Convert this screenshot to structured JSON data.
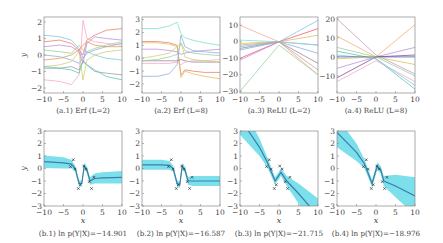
{
  "chart_data": [
    {
      "id": "a1",
      "type": "line",
      "title": "(a.1) Erf (L=2)",
      "xlabel": "",
      "ylabel": "y",
      "xlim": [
        -10,
        10
      ],
      "ylim": [
        -2.3,
        2.3
      ],
      "xticks": [
        -10,
        -5,
        0,
        5,
        10
      ],
      "yticks": [
        -2,
        -1,
        0,
        1,
        2
      ],
      "x": [
        -10,
        -6,
        -3,
        -1,
        0,
        1,
        3,
        6,
        10
      ],
      "series": [
        {
          "name": "s1",
          "color": "#7ec8e3",
          "values": [
            1.2,
            1.1,
            0.9,
            0.4,
            -0.2,
            0.2,
            0.0,
            -0.2,
            -0.3
          ]
        },
        {
          "name": "s2",
          "color": "#f08070",
          "values": [
            0.8,
            0.9,
            0.7,
            0.3,
            0.0,
            0.9,
            1.2,
            1.5,
            1.6
          ]
        },
        {
          "name": "s3",
          "color": "#9ad0a0",
          "values": [
            0.3,
            0.2,
            0.1,
            0.6,
            0.3,
            0.2,
            0.4,
            0.6,
            0.8
          ]
        },
        {
          "name": "s4",
          "color": "#f7a8d0",
          "values": [
            -1.5,
            -1.6,
            -1.8,
            -1.2,
            2.1,
            1.0,
            0.8,
            0.7,
            0.6
          ]
        },
        {
          "name": "s5",
          "color": "#8fb0e0",
          "values": [
            0.0,
            -0.1,
            -0.3,
            -0.5,
            -0.2,
            0.1,
            0.3,
            0.5,
            0.7
          ]
        },
        {
          "name": "s6",
          "color": "#e0a050",
          "values": [
            -0.3,
            -0.2,
            0.0,
            0.3,
            0.6,
            0.8,
            0.6,
            0.5,
            0.5
          ]
        },
        {
          "name": "s7",
          "color": "#a0a0a0",
          "values": [
            -0.8,
            -0.8,
            -0.7,
            -0.9,
            -0.4,
            -0.6,
            -1.0,
            -1.1,
            -1.2
          ]
        },
        {
          "name": "s8",
          "color": "#d0d070",
          "values": [
            -0.7,
            -0.6,
            -0.4,
            0.2,
            -1.5,
            -0.3,
            0.0,
            0.2,
            0.3
          ]
        },
        {
          "name": "s9",
          "color": "#60c8c0",
          "values": [
            -0.7,
            -0.8,
            -0.9,
            -1.1,
            -0.3,
            -0.6,
            -0.9,
            -1.3,
            -1.5
          ]
        },
        {
          "name": "s10",
          "color": "#c090e0",
          "values": [
            0.5,
            0.6,
            0.5,
            0.2,
            -0.5,
            0.7,
            1.1,
            1.0,
            0.9
          ]
        }
      ]
    },
    {
      "id": "a2",
      "type": "line",
      "title": "(a.2) Erf (L=8)",
      "xlabel": "",
      "ylabel": "",
      "xlim": [
        -10,
        10
      ],
      "ylim": [
        -2.7,
        3.2
      ],
      "xticks": [
        -10,
        -5,
        0,
        5,
        10
      ],
      "yticks": [
        -2,
        -1,
        0,
        1,
        2,
        3
      ],
      "x": [
        -10,
        -6,
        -3,
        -1,
        0,
        1,
        3,
        6,
        10
      ],
      "series": [
        {
          "name": "s1",
          "color": "#80e0d0",
          "values": [
            2.3,
            2.3,
            2.5,
            2.8,
            1.9,
            1.6,
            1.4,
            1.2,
            1.0
          ]
        },
        {
          "name": "s2",
          "color": "#f08070",
          "values": [
            1.3,
            1.3,
            1.2,
            1.0,
            -1.3,
            -0.9,
            -1.0,
            -1.1,
            -1.1
          ]
        },
        {
          "name": "s3",
          "color": "#e0c060",
          "values": [
            1.2,
            1.2,
            1.1,
            0.9,
            -1.5,
            -1.0,
            -1.2,
            -1.4,
            -1.6
          ]
        },
        {
          "name": "s4",
          "color": "#c090e0",
          "values": [
            0.7,
            0.7,
            0.6,
            0.5,
            0.3,
            0.4,
            0.5,
            0.6,
            0.7
          ]
        },
        {
          "name": "s5",
          "color": "#8fb0e0",
          "values": [
            -1.4,
            -1.4,
            -1.2,
            -0.5,
            1.8,
            0.9,
            0.6,
            0.5,
            0.4
          ]
        },
        {
          "name": "s6",
          "color": "#909090",
          "values": [
            -0.2,
            -0.2,
            -0.2,
            -0.2,
            -0.1,
            -0.2,
            -0.3,
            -0.3,
            -0.3
          ]
        },
        {
          "name": "s7",
          "color": "#f7a8d0",
          "values": [
            -0.4,
            -0.4,
            -0.4,
            -0.3,
            -0.5,
            -0.3,
            -0.2,
            -0.2,
            -0.1
          ]
        },
        {
          "name": "s8",
          "color": "#9ad0a0",
          "values": [
            -0.2,
            -0.1,
            0.1,
            0.3,
            1.2,
            0.6,
            0.4,
            0.3,
            0.2
          ]
        },
        {
          "name": "s9",
          "color": "#d0d070",
          "values": [
            0.0,
            0.2,
            0.4,
            0.9,
            1.2,
            0.1,
            -0.1,
            -0.2,
            -0.3
          ]
        }
      ]
    },
    {
      "id": "a3",
      "type": "line",
      "title": "(a.3) ReLU (L=2)",
      "xlabel": "",
      "ylabel": "",
      "xlim": [
        -10,
        10
      ],
      "ylim": [
        -31,
        15
      ],
      "xticks": [
        -10,
        -5,
        0,
        5,
        10
      ],
      "yticks": [
        -30,
        -20,
        -10,
        0,
        10
      ],
      "x": [
        -10,
        0,
        10
      ],
      "series": [
        {
          "name": "s1",
          "color": "#f0b0a0",
          "values": [
            10,
            0,
            -20
          ]
        },
        {
          "name": "s2",
          "color": "#7ec8e3",
          "values": [
            -3,
            0,
            13
          ]
        },
        {
          "name": "s3",
          "color": "#f06070",
          "values": [
            -10,
            0,
            8
          ]
        },
        {
          "name": "s4",
          "color": "#9ad0a0",
          "values": [
            -30,
            -2,
            -20
          ]
        },
        {
          "name": "s5",
          "color": "#e0c060",
          "values": [
            -1,
            0,
            4
          ]
        },
        {
          "name": "s6",
          "color": "#c090e0",
          "values": [
            -11,
            0,
            -2
          ]
        },
        {
          "name": "s7",
          "color": "#909090",
          "values": [
            -4,
            0,
            -13
          ]
        },
        {
          "name": "s8",
          "color": "#80e0d0",
          "values": [
            1,
            0,
            -2
          ]
        },
        {
          "name": "s9",
          "color": "#8fb0e0",
          "values": [
            -5,
            0,
            -7
          ]
        },
        {
          "name": "s10",
          "color": "#d0a0a0",
          "values": [
            -2,
            0,
            -17
          ]
        }
      ]
    },
    {
      "id": "a4",
      "type": "line",
      "title": "(a.4) ReLU (L=8)",
      "xlabel": "",
      "ylabel": "",
      "xlim": [
        -10,
        10
      ],
      "ylim": [
        -19,
        21
      ],
      "xticks": [
        -10,
        -5,
        0,
        5,
        10
      ],
      "yticks": [
        -10,
        0,
        10,
        20
      ],
      "x": [
        -10,
        0,
        10
      ],
      "series": [
        {
          "name": "s1",
          "color": "#c0a0c0",
          "values": [
            20,
            1,
            -9
          ]
        },
        {
          "name": "s2",
          "color": "#f0b070",
          "values": [
            11,
            0,
            17
          ]
        },
        {
          "name": "s3",
          "color": "#9ad0a0",
          "values": [
            5,
            0,
            -10
          ]
        },
        {
          "name": "s4",
          "color": "#60c0c0",
          "values": [
            3,
            -1,
            -17
          ]
        },
        {
          "name": "s5",
          "color": "#c090e0",
          "values": [
            -6,
            0,
            5
          ]
        },
        {
          "name": "s6",
          "color": "#8050a0",
          "values": [
            -11,
            0,
            1
          ]
        },
        {
          "name": "s7",
          "color": "#f7a8d0",
          "values": [
            -13,
            -2,
            -13
          ]
        },
        {
          "name": "s8",
          "color": "#7ec8e3",
          "values": [
            1,
            -1,
            -15
          ]
        },
        {
          "name": "s9",
          "color": "#4060a0",
          "values": [
            0,
            0,
            0
          ]
        },
        {
          "name": "s10",
          "color": "#e0c060",
          "values": [
            -1,
            0,
            -4
          ]
        }
      ]
    },
    {
      "id": "b1",
      "type": "line",
      "title": "(b.1) ln p(Y|X)=−14.901",
      "xlabel": "x",
      "ylabel": "y",
      "xlim": [
        -10,
        10
      ],
      "ylim": [
        -3,
        3
      ],
      "xticks": [
        -10,
        -5,
        0,
        5,
        10
      ],
      "yticks": [
        -3,
        -2,
        -1,
        0,
        1,
        2,
        3
      ],
      "x": [
        -10,
        -5,
        -3,
        -2,
        -1,
        -0.3,
        0.3,
        1,
        1.8,
        3,
        5,
        10
      ],
      "mean": [
        0.55,
        0.45,
        0.35,
        0.0,
        -1.2,
        -1.2,
        0.2,
        -0.1,
        -1.0,
        -0.8,
        -0.75,
        -0.7
      ],
      "band_halfwidth": [
        0.5,
        0.45,
        0.35,
        0.25,
        0.25,
        0.25,
        0.25,
        0.25,
        0.3,
        0.4,
        0.45,
        0.5
      ],
      "points": {
        "x": [
          -3.2,
          -2.5,
          -2.0,
          -1.2,
          -0.7,
          0.2,
          0.8,
          1.6,
          2.2,
          2.8
        ],
        "y": [
          0.15,
          0.7,
          -0.05,
          -1.6,
          -1.3,
          0.2,
          -0.05,
          -1.05,
          -1.6,
          -0.7
        ]
      },
      "log_likelihood": -14.901
    },
    {
      "id": "b2",
      "type": "line",
      "title": "(b.2) ln p(Y|X)=−16.587",
      "xlabel": "x",
      "ylabel": "",
      "xlim": [
        -10,
        10
      ],
      "ylim": [
        -3,
        3
      ],
      "xticks": [
        -10,
        -5,
        0,
        5,
        10
      ],
      "yticks": [
        -3,
        -2,
        -1,
        0,
        1,
        2,
        3
      ],
      "x": [
        -10,
        -5,
        -3,
        -2,
        -1,
        -0.3,
        0.3,
        1,
        1.8,
        3,
        5,
        10
      ],
      "mean": [
        0.3,
        0.3,
        0.25,
        0.0,
        -1.2,
        -1.3,
        0.2,
        -0.1,
        -1.0,
        -1.0,
        -1.0,
        -1.0
      ],
      "band_halfwidth": [
        0.4,
        0.4,
        0.35,
        0.25,
        0.25,
        0.25,
        0.25,
        0.25,
        0.3,
        0.4,
        0.4,
        0.4
      ],
      "points": {
        "x": [
          -3.2,
          -2.5,
          -2.0,
          -1.2,
          -0.7,
          0.2,
          0.8,
          1.6,
          2.2,
          2.8
        ],
        "y": [
          0.15,
          0.7,
          -0.05,
          -1.6,
          -1.3,
          0.2,
          -0.05,
          -1.05,
          -1.6,
          -0.7
        ]
      },
      "log_likelihood": -16.587
    },
    {
      "id": "b3",
      "type": "line",
      "title": "(b.3) ln p(Y|X)=−21.715",
      "xlabel": "x",
      "ylabel": "",
      "xlim": [
        -10,
        10
      ],
      "ylim": [
        -3,
        3
      ],
      "xticks": [
        -10,
        -5,
        0,
        5,
        10
      ],
      "yticks": [
        -3,
        -2,
        -1,
        0,
        1,
        2,
        3
      ],
      "x": [
        -10,
        -5,
        -3,
        -1,
        0.5,
        2,
        5,
        10
      ],
      "mean": [
        4.0,
        1.7,
        0.5,
        -1.0,
        -0.3,
        -1.0,
        -2.0,
        -3.8
      ],
      "band_halfwidth": [
        1.3,
        0.7,
        0.4,
        0.3,
        0.3,
        0.4,
        0.8,
        1.4
      ],
      "points": {
        "x": [
          -3.2,
          -2.5,
          -2.0,
          -1.2,
          -0.7,
          0.2,
          0.8,
          1.6,
          2.2,
          2.8
        ],
        "y": [
          0.15,
          0.7,
          -0.05,
          -1.6,
          -1.3,
          0.2,
          -0.05,
          -1.05,
          -1.6,
          -0.7
        ]
      },
      "log_likelihood": -21.715
    },
    {
      "id": "b4",
      "type": "line",
      "title": "(b.4) ln p(Y|X)=−18.976",
      "xlabel": "x",
      "ylabel": "",
      "xlim": [
        -10,
        10
      ],
      "ylim": [
        -3,
        3
      ],
      "xticks": [
        -10,
        -5,
        0,
        5,
        10
      ],
      "yticks": [
        -3,
        -2,
        -1,
        0,
        1,
        2,
        3
      ],
      "x": [
        -10,
        -5,
        -3,
        -1,
        0.3,
        1.2,
        2,
        5,
        10
      ],
      "mean": [
        2.9,
        1.3,
        0.4,
        -1.2,
        0.2,
        -0.1,
        -1.0,
        -1.4,
        -2.2
      ],
      "band_halfwidth": [
        1.2,
        0.7,
        0.35,
        0.3,
        0.3,
        0.3,
        0.4,
        0.9,
        1.5
      ],
      "points": {
        "x": [
          -3.2,
          -2.5,
          -2.0,
          -1.2,
          -0.7,
          0.2,
          0.8,
          1.6,
          2.2,
          2.8
        ],
        "y": [
          0.15,
          0.7,
          -0.05,
          -1.6,
          -1.3,
          0.2,
          -0.05,
          -1.05,
          -1.6,
          -0.7
        ]
      },
      "log_likelihood": -18.976
    }
  ],
  "style": {
    "band_color": "#5ad8e6",
    "mean_color": "#3b7fa8",
    "point_color": "#333333"
  }
}
